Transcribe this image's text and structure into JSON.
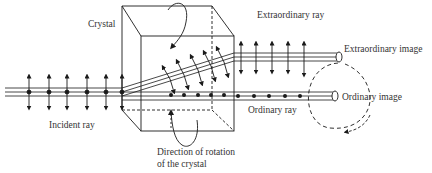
{
  "diagram": {
    "labels": {
      "crystal": "Crystal",
      "extraordinary_ray": "Extraordinary ray",
      "extraordinary_image": "Extraordinary image",
      "ordinary_ray": "Ordinary ray",
      "ordinary_image": "Ordinary image",
      "incident_ray": "Incident ray",
      "rotation_line1": "Direction of rotation",
      "rotation_line2": "of the crystal"
    },
    "colors": {
      "ink": "#1a1a1a",
      "text": "#333333",
      "background": "#ffffff"
    }
  }
}
